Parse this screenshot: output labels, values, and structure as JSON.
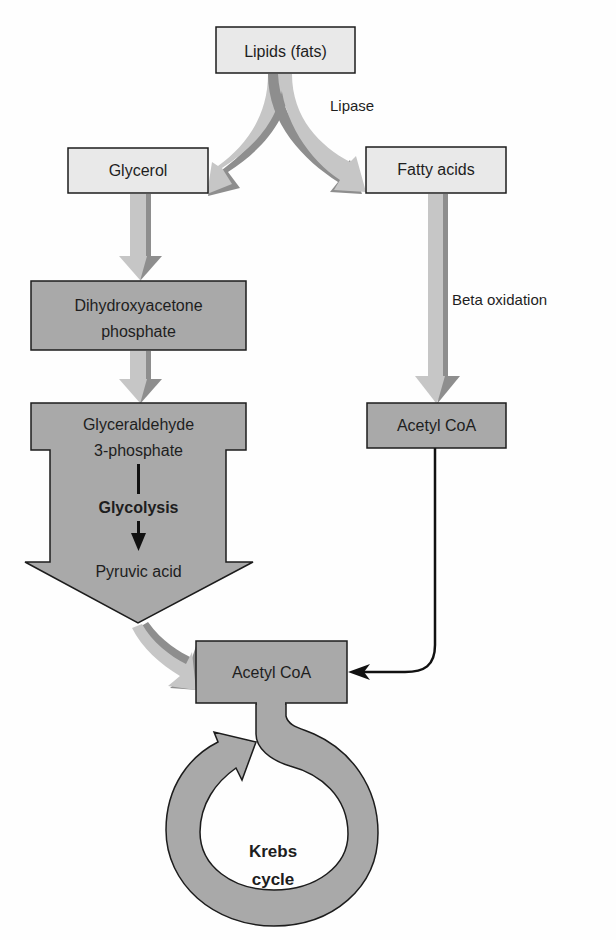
{
  "diagram": {
    "nodes": {
      "lipids": "Lipids (fats)",
      "glycerol": "Glycerol",
      "fatty_acids": "Fatty acids",
      "dhap_line1": "Dihydroxyacetone",
      "dhap_line2": "phosphate",
      "g3p_line1": "Glyceraldehyde",
      "g3p_line2": "3-phosphate",
      "pyruvic_acid": "Pyruvic acid",
      "acetyl_coa_right": "Acetyl CoA",
      "acetyl_coa_bottom": "Acetyl CoA",
      "krebs_line1": "Krebs",
      "krebs_line2": "cycle"
    },
    "edge_labels": {
      "lipase": "Lipase",
      "beta_oxidation": "Beta oxidation",
      "glycolysis": "Glycolysis"
    },
    "edges": [
      {
        "from": "Lipids (fats)",
        "to": "Glycerol",
        "label": "Lipase"
      },
      {
        "from": "Lipids (fats)",
        "to": "Fatty acids",
        "label": "Lipase"
      },
      {
        "from": "Glycerol",
        "to": "Dihydroxyacetone phosphate"
      },
      {
        "from": "Dihydroxyacetone phosphate",
        "to": "Glyceraldehyde 3-phosphate"
      },
      {
        "from": "Glyceraldehyde 3-phosphate",
        "to": "Pyruvic acid",
        "label": "Glycolysis"
      },
      {
        "from": "Pyruvic acid",
        "to": "Acetyl CoA"
      },
      {
        "from": "Fatty acids",
        "to": "Acetyl CoA",
        "label": "Beta oxidation"
      },
      {
        "from": "Acetyl CoA",
        "to": "Acetyl CoA (Krebs entry)"
      },
      {
        "from": "Acetyl CoA",
        "to": "Krebs cycle"
      }
    ],
    "colors": {
      "light_box": "#e9e9e9",
      "dark_box": "#a9a9a9",
      "flow_arrow": "#c6c6c6",
      "flow_arrow_edge": "#8e8e8e",
      "outline": "#1c1c1c"
    }
  }
}
